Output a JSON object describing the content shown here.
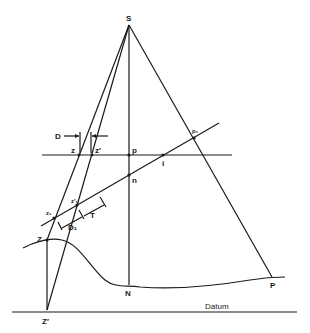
{
  "diagram": {
    "labels": {
      "S": "S",
      "p": "p",
      "p1": "p₁",
      "n": "n",
      "i": "i",
      "z": "z",
      "z_prime": "z′",
      "z1": "z₁",
      "z1_prime": "z′₁",
      "D": "D",
      "D1": "D₁",
      "T": "T",
      "Z": "Z",
      "Z_prime": "Z′",
      "N": "N",
      "P": "P",
      "datum": "Datum"
    },
    "colors": {
      "line": "#1a1a1a",
      "background": "#ffffff"
    }
  }
}
